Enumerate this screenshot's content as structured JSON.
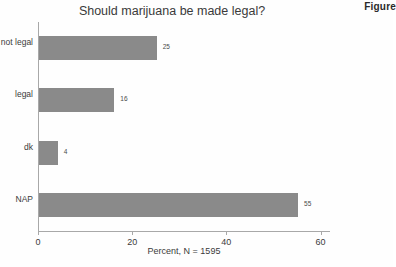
{
  "figure_caption": "Figure",
  "chart_data": {
    "type": "bar",
    "orientation": "horizontal",
    "title": "Should marijuana be made legal?",
    "xlabel": "Percent, N = 1595",
    "ylabel": "",
    "categories": [
      "not legal",
      "legal",
      "dk",
      "NAP"
    ],
    "values": [
      25,
      16,
      4,
      55
    ],
    "value_labels": [
      "25",
      "16",
      "4",
      "55"
    ],
    "xlim": [
      0,
      62
    ],
    "xticks": [
      0,
      20,
      40,
      60
    ],
    "xtick_labels": [
      "0",
      "20",
      "40",
      "60"
    ],
    "grid": false,
    "legend": false,
    "bar_color": "#8a8a8a",
    "axis_color": "#a8a8a8",
    "background": "#fefefe"
  }
}
